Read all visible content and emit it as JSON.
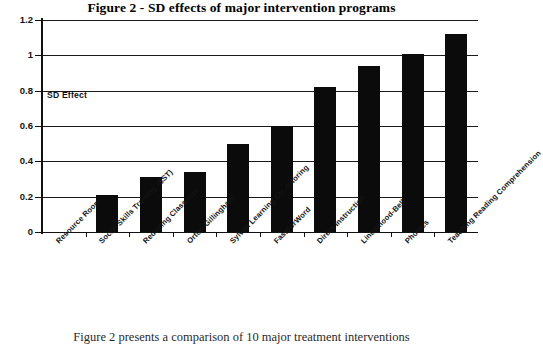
{
  "chart_data": {
    "type": "bar",
    "title": "Figure 2 - SD effects of major intervention programs",
    "xlabel": "",
    "ylabel": "SD Effect",
    "ylim": [
      0,
      1.2
    ],
    "ytick_labels": [
      "0",
      "0.2",
      "0.4",
      "0.6",
      "0.8",
      "1",
      "1.2"
    ],
    "ytick_values": [
      0,
      0.2,
      0.4,
      0.6,
      0.8,
      1,
      1.2
    ],
    "grid": true,
    "legend": "none",
    "categories": [
      "Resource Room",
      "Social Skills Training (SST)",
      "Reducing Class size",
      "Orton-Gillingham",
      "Sylvan Learning Ctr.-tutoring",
      "FastForWord",
      "Direct Instruction",
      "Lindamood-Bell",
      "Phonics",
      "Teaching Reading Comprehension"
    ],
    "values": [
      0,
      0.21,
      0.31,
      0.34,
      0.5,
      0.6,
      0.82,
      0.94,
      1.01,
      1.12
    ],
    "annotation": "SD Effect",
    "bar_color": "#0b0b0b"
  },
  "caption": {
    "text": "Figure 2 presents a comparison of 10 major treatment interventions"
  }
}
